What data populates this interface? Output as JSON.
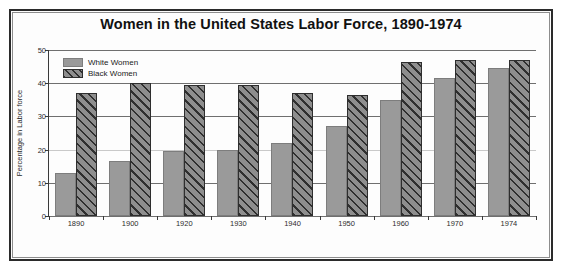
{
  "chart_data": {
    "type": "bar",
    "title": "Women in the United States Labor Force, 1890-1974",
    "xlabel": "",
    "ylabel": "Percentage in Labor force",
    "categories": [
      "1890",
      "1900",
      "1920",
      "1930",
      "1940",
      "1950",
      "1960",
      "1970",
      "1974"
    ],
    "series": [
      {
        "name": "White Women",
        "pattern": "solid-gray",
        "color": "#9a9a9a",
        "values": [
          13,
          16.5,
          19.5,
          20,
          22,
          27,
          35,
          41.5,
          44.5
        ]
      },
      {
        "name": "Black Women",
        "pattern": "diagonal-hatch",
        "color": "#8e8e8e",
        "values": [
          37,
          40,
          39.5,
          39.5,
          37,
          36.5,
          46.5,
          47,
          47
        ]
      }
    ],
    "ylim": [
      0,
      50
    ],
    "yticks": [
      0,
      10,
      20,
      30,
      40,
      50
    ],
    "ytick_labels": [
      "0",
      "10",
      "20",
      "30",
      "40",
      "50"
    ],
    "grid": true,
    "legend_position": "top-left-inside"
  },
  "legend": {
    "items": [
      {
        "label": "White Women"
      },
      {
        "label": "Black Women"
      }
    ]
  },
  "colors": {
    "frame": "#2b2b2b",
    "grid": "#6f6f6f",
    "axis": "#3a3a3a",
    "white_women": "#9a9a9a",
    "black_women_hatch": "#2f2f2f",
    "background": "#ffffff"
  }
}
